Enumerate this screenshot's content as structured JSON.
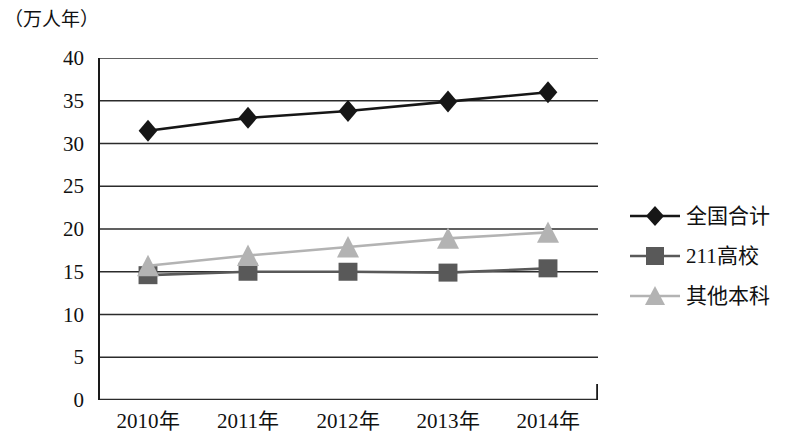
{
  "chart_data": {
    "type": "line",
    "title": "",
    "subtitle": "",
    "xlabel": "",
    "ylabel": "（万人年）",
    "y_unit_caption": "（万人年）",
    "categories": [
      "2010年",
      "2011年",
      "2012年",
      "2013年",
      "2014年"
    ],
    "ylim": [
      0,
      40
    ],
    "y_ticks": [
      0,
      5,
      10,
      15,
      20,
      25,
      30,
      35,
      40
    ],
    "y_tick_labels": [
      "0",
      "5",
      "10",
      "15",
      "20",
      "25",
      "30",
      "35",
      "40"
    ],
    "grid": true,
    "legend_position": "right",
    "series": [
      {
        "name": "全国合计",
        "marker": "diamond",
        "color": "#161616",
        "values": [
          31.5,
          33.0,
          33.8,
          34.9,
          36.0
        ]
      },
      {
        "name": "211高校",
        "marker": "square",
        "color": "#595959",
        "values": [
          14.6,
          15.0,
          15.0,
          14.9,
          15.4
        ]
      },
      {
        "name": "其他本科",
        "marker": "triangle",
        "color": "#b3b3b3",
        "values": [
          15.7,
          16.9,
          17.9,
          18.9,
          19.6
        ]
      }
    ]
  },
  "legend": {
    "items": [
      {
        "label": "全国合计"
      },
      {
        "label": "211高校"
      },
      {
        "label": "其他本科"
      }
    ]
  },
  "colors": {
    "axis": "#1a1a1a",
    "grid": "#2b2b2b",
    "background": "#ffffff",
    "series_total": "#161616",
    "series_211": "#595959",
    "series_other": "#b3b3b3"
  }
}
